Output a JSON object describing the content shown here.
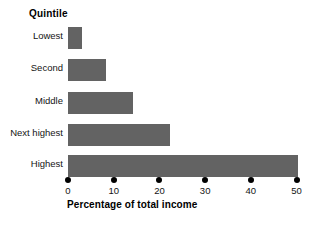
{
  "chart_data": {
    "type": "bar",
    "orientation": "horizontal",
    "title": "Quintile",
    "xlabel": "Percentage of total income",
    "ylabel": "Quintile",
    "categories": [
      "Lowest",
      "Second",
      "Middle",
      "Next highest",
      "Highest"
    ],
    "values": [
      3.1,
      8.4,
      14.3,
      22.4,
      50.4
    ],
    "xlim": [
      0,
      52.5
    ],
    "xticks": [
      0,
      10,
      20,
      30,
      40,
      50
    ],
    "xtick_labels": [
      "0",
      "10",
      "20",
      "30",
      "40",
      "50"
    ],
    "grid": false,
    "legend": false,
    "bar_color": "#636363",
    "background_color": "#ffffff",
    "tick_marker": "filled-dot"
  }
}
